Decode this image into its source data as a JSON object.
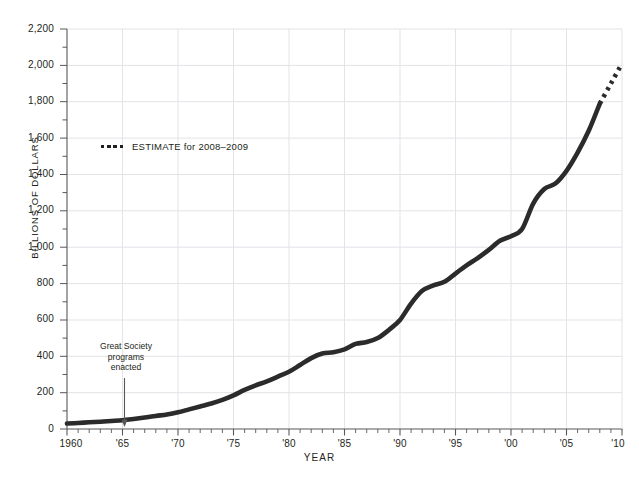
{
  "figure": {
    "cropped_caption": "",
    "background": "#ffffff",
    "line_color": "#2b2b2b",
    "grid_color": "#e3e3e8",
    "axis_color": "#58585b"
  },
  "axes": {
    "y_title": "BILLIONS OF DOLLARS",
    "x_title": "YEAR",
    "y_ticks": [
      "0",
      "200",
      "400",
      "600",
      "800",
      "1,000",
      "1,200",
      "1,400",
      "1,600",
      "1,800",
      "2,000",
      "2,200"
    ],
    "x_ticks": [
      "1960",
      "'65",
      "'70",
      "'75",
      "'80",
      "'85",
      "'90",
      "'95",
      "'00",
      "'05",
      "'10"
    ]
  },
  "legend": {
    "marker": "dotted-line-swatch",
    "label": "ESTIMATE for 2008–2009"
  },
  "annotation": {
    "line1": "Great Society",
    "line2": "programs",
    "line3": "enacted",
    "arrow": "down-arrow-icon",
    "points_to_year": 1965
  },
  "chart_data": {
    "type": "line",
    "title": "",
    "xlabel": "YEAR",
    "ylabel": "BILLIONS OF DOLLARS",
    "xlim": [
      1960,
      2010
    ],
    "ylim": [
      0,
      2200
    ],
    "ytick_step": 200,
    "xtick_step": 5,
    "minor_xtick_step": 1,
    "grid": "both",
    "legend_position": "upper-left-inside",
    "series": [
      {
        "name": "Actual",
        "style": "solid",
        "x": [
          1960,
          1961,
          1962,
          1963,
          1964,
          1965,
          1966,
          1967,
          1968,
          1969,
          1970,
          1971,
          1972,
          1973,
          1974,
          1975,
          1976,
          1977,
          1978,
          1979,
          1980,
          1981,
          1982,
          1983,
          1984,
          1985,
          1986,
          1987,
          1988,
          1989,
          1990,
          1991,
          1992,
          1993,
          1994,
          1995,
          1996,
          1997,
          1998,
          1999,
          2000,
          2001,
          2002,
          2003,
          2004,
          2005,
          2006,
          2007,
          2008
        ],
        "values": [
          30,
          33,
          37,
          40,
          44,
          48,
          55,
          63,
          72,
          80,
          92,
          108,
          124,
          140,
          160,
          185,
          215,
          240,
          262,
          288,
          315,
          352,
          390,
          415,
          422,
          438,
          468,
          478,
          500,
          545,
          600,
          690,
          760,
          790,
          810,
          855,
          900,
          940,
          985,
          1035,
          1060,
          1100,
          1240,
          1320,
          1350,
          1420,
          1520,
          1640,
          1790
        ]
      },
      {
        "name": "ESTIMATE for 2008–2009",
        "style": "dotted",
        "x": [
          2008,
          2009,
          2010
        ],
        "values": [
          1790,
          1900,
          2010
        ]
      }
    ]
  }
}
